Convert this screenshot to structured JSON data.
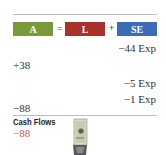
{
  "equation": {
    "assets": {
      "label": "A",
      "color": "#7a9a3a"
    },
    "equals": "=",
    "liabilities": {
      "label": "L",
      "color": "#a8322a"
    },
    "plus": "+",
    "equity": {
      "label": "SE",
      "color": "#3b6cb5"
    }
  },
  "entries": [
    {
      "text": "−44 Exp",
      "column": "SE"
    },
    {
      "text": "+38",
      "column": "A"
    },
    {
      "text": "−5 Exp",
      "column": "SE"
    },
    {
      "text": "−1 Exp",
      "column": "SE"
    },
    {
      "text": "−88",
      "column": "A"
    }
  ],
  "cash_flows": {
    "title": "Cash Flows",
    "value": "−88",
    "value_color": "#d0584a",
    "icon": "money-bill-icon"
  }
}
